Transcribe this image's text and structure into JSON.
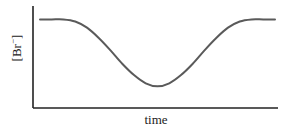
{
  "chart_data": {
    "type": "line",
    "title": "",
    "xlabel": "time",
    "ylabel": "[Br⁻]",
    "ylabel_base": "[Br",
    "ylabel_sup": "−",
    "ylabel_close": "]",
    "x_ticks": [],
    "y_ticks": [],
    "grid": false,
    "legend": null,
    "xlim": [
      0,
      1
    ],
    "ylim": [
      0,
      1
    ],
    "series": [
      {
        "name": "[Br-]",
        "color": "#5a5a5a",
        "x": [
          0.0,
          0.05,
          0.1,
          0.15,
          0.2,
          0.25,
          0.3,
          0.35,
          0.4,
          0.45,
          0.5,
          0.55,
          0.6,
          0.65,
          0.7,
          0.75,
          0.8,
          0.85,
          0.9,
          0.95,
          1.0
        ],
        "values": [
          0.86,
          0.86,
          0.86,
          0.84,
          0.78,
          0.68,
          0.56,
          0.43,
          0.32,
          0.24,
          0.21,
          0.24,
          0.32,
          0.43,
          0.56,
          0.68,
          0.78,
          0.84,
          0.86,
          0.86,
          0.86
        ]
      }
    ],
    "annotations": []
  },
  "colors": {
    "axis": "#222222",
    "curve": "#5a5a5a",
    "background": "#ffffff"
  }
}
